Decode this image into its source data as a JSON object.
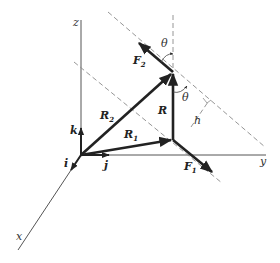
{
  "diagram": {
    "axes": {
      "x": "x",
      "y": "y",
      "z": "z"
    },
    "unit_vectors": {
      "i": "i",
      "j": "j",
      "k": "k"
    },
    "vectors": {
      "R": "R",
      "R1": {
        "base": "R",
        "sub": "1"
      },
      "R2": {
        "base": "R",
        "sub": "2"
      },
      "F1": {
        "base": "F",
        "sub": "1"
      },
      "F2": {
        "base": "F",
        "sub": "2"
      }
    },
    "angles": {
      "theta_top": "θ",
      "theta_mid": "θ"
    },
    "distance": {
      "h": "h"
    },
    "colors": {
      "line": "#222222",
      "dashed": "#8a8a8a",
      "axis": "#555555"
    }
  }
}
